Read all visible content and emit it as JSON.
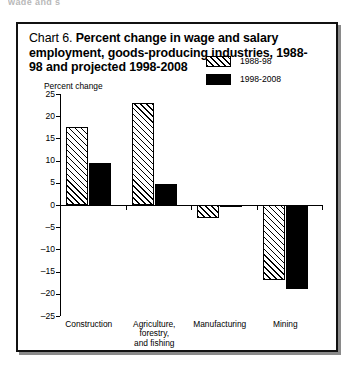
{
  "scan_fragment": "wage and s",
  "chart_box": {
    "title_prefix": "Chart 6. ",
    "title": "Percent change in wage and salary employment, goods-producing industries, 1988-98 and projected 1998-2008",
    "axis_caption": "Percent change"
  },
  "chart_data": {
    "type": "bar",
    "title": "Chart 6. Percent change in wage and salary employment, goods-producing industries, 1988-98 and projected 1998-2008",
    "xlabel": "",
    "ylabel": "Percent change",
    "ylim": [
      -25,
      25
    ],
    "yticks": [
      25,
      20,
      15,
      10,
      5,
      0,
      -5,
      -10,
      -15,
      -20,
      -25
    ],
    "ytick_labels": [
      "25",
      "20",
      "15",
      "10",
      "5",
      "0",
      "–5",
      "–10",
      "–15",
      "–20",
      "–25"
    ],
    "grid": false,
    "legend_position": "upper right",
    "categories": [
      "Construction",
      "Agriculture,\nforestry,\nand fishing",
      "Manufacturing",
      "Mining"
    ],
    "series": [
      {
        "name": "1988-98",
        "values": [
          17.5,
          23.0,
          -3.0,
          -16.8
        ]
      },
      {
        "name": "1998-2008",
        "values": [
          9.5,
          4.7,
          -0.4,
          -19.0
        ]
      }
    ]
  }
}
